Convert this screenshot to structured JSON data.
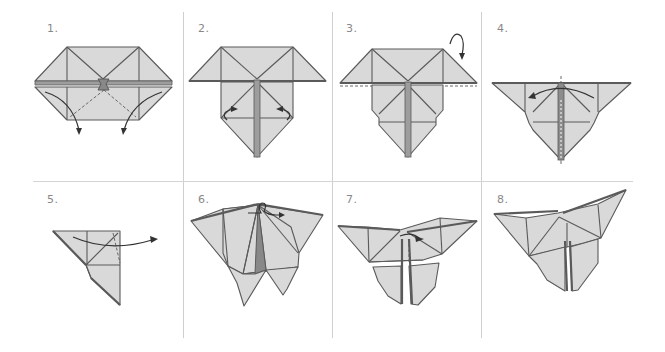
{
  "diagram": {
    "colors": {
      "paper_fill": "#d9d9d9",
      "stroke": "#5a5a5a",
      "divider": "#cfcfcf",
      "arrow": "#333333",
      "label": "#888888"
    },
    "layout": {
      "rows": 2,
      "columns": 4,
      "vertical_dividers_x": [
        183,
        332,
        481
      ],
      "horizontal_divider_y": 181
    },
    "steps": [
      {
        "number": "1.",
        "description": "Pull lower corners outward and down along dashed valley folds",
        "arrows": 2,
        "icon": "pull-down-arrows"
      },
      {
        "number": "2.",
        "description": "Fold lower side flaps inward toward center crease",
        "arrows": 2,
        "icon": "fold-in-arrows"
      },
      {
        "number": "3.",
        "description": "Turn over (mountain fold along top edge)",
        "arrows": 1,
        "icon": "turn-over-arrow"
      },
      {
        "number": "4.",
        "description": "Fold in half along vertical center line",
        "arrows": 1,
        "icon": "fold-half-arrow"
      },
      {
        "number": "5.",
        "description": "Fold flap back along dashed line",
        "arrows": 1,
        "icon": "fold-back-arrow"
      },
      {
        "number": "6.",
        "description": "Turn model over",
        "arrows": 1,
        "icon": "turn-over-loop-icon"
      },
      {
        "number": "7.",
        "description": "Pinch center and fold along dashed line",
        "arrows": 1,
        "icon": "pinch-arrow"
      },
      {
        "number": "8.",
        "description": "Completed butterfly",
        "arrows": 0,
        "icon": ""
      }
    ]
  }
}
